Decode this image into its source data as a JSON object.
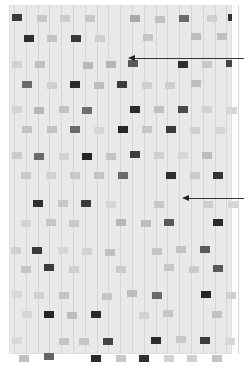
{
  "figure": {
    "kind": "sequencing gel autoradiograph",
    "gel_box": {
      "x": 9,
      "y": 5,
      "w": 223,
      "h": 349
    },
    "lane_pitch": 11.8,
    "arrows": [
      {
        "name": "upper-arrow",
        "tip_x": 128,
        "tip_y": 58,
        "tail_x": 244
      },
      {
        "name": "lower-arrow",
        "tip_x": 182,
        "tip_y": 198,
        "tail_x": 244
      }
    ],
    "bands": [
      {
        "x": 10,
        "y": 12,
        "c": "#3a3a3a"
      },
      {
        "x": 35,
        "y": 13,
        "c": "#c8c8c8"
      },
      {
        "x": 58,
        "y": 13,
        "c": "#cccccc"
      },
      {
        "x": 83,
        "y": 13,
        "c": "#c8c8c8"
      },
      {
        "x": 128,
        "y": 13,
        "c": "#a9a9a9"
      },
      {
        "x": 153,
        "y": 14,
        "c": "#c2c2c2"
      },
      {
        "x": 177,
        "y": 13,
        "c": "#6a6a6a"
      },
      {
        "x": 205,
        "y": 13,
        "c": "#d0d0d0"
      },
      {
        "x": 226,
        "y": 12,
        "c": "#333333",
        "w": 4
      },
      {
        "x": 22,
        "y": 33,
        "c": "#2e2e2e"
      },
      {
        "x": 45,
        "y": 33,
        "c": "#c4c4c4"
      },
      {
        "x": 69,
        "y": 33,
        "c": "#3a3a3a"
      },
      {
        "x": 93,
        "y": 33,
        "c": "#cfcfcf"
      },
      {
        "x": 141,
        "y": 32,
        "c": "#c6c6c6"
      },
      {
        "x": 189,
        "y": 31,
        "c": "#bdbdbd"
      },
      {
        "x": 215,
        "y": 31,
        "c": "#c0c0c0"
      },
      {
        "x": 10,
        "y": 59,
        "c": "#d2d2d2"
      },
      {
        "x": 33,
        "y": 59,
        "c": "#c0c0c0"
      },
      {
        "x": 81,
        "y": 60,
        "c": "#b8b8b8"
      },
      {
        "x": 104,
        "y": 59,
        "c": "#b5b5b5"
      },
      {
        "x": 126,
        "y": 58,
        "c": "#5a5a5a"
      },
      {
        "x": 176,
        "y": 59,
        "c": "#2f2f2f"
      },
      {
        "x": 200,
        "y": 59,
        "c": "#c8c8c8"
      },
      {
        "x": 224,
        "y": 58,
        "c": "#444444",
        "w": 6
      },
      {
        "x": 20,
        "y": 79,
        "c": "#6a6a6a"
      },
      {
        "x": 45,
        "y": 80,
        "c": "#d0d0d0"
      },
      {
        "x": 68,
        "y": 79,
        "c": "#2a2a2a"
      },
      {
        "x": 92,
        "y": 80,
        "c": "#bdbdbd"
      },
      {
        "x": 115,
        "y": 79,
        "c": "#3c3c3c"
      },
      {
        "x": 140,
        "y": 80,
        "c": "#cfcfcf"
      },
      {
        "x": 163,
        "y": 80,
        "c": "#cdcdcd"
      },
      {
        "x": 189,
        "y": 78,
        "c": "#bebebe"
      },
      {
        "x": 10,
        "y": 104,
        "c": "#d4d4d4"
      },
      {
        "x": 32,
        "y": 105,
        "c": "#b8b8b8"
      },
      {
        "x": 57,
        "y": 104,
        "c": "#c2c2c2"
      },
      {
        "x": 80,
        "y": 105,
        "c": "#6e6e6e"
      },
      {
        "x": 128,
        "y": 104,
        "c": "#2a2a2a"
      },
      {
        "x": 152,
        "y": 104,
        "c": "#c0c0c0"
      },
      {
        "x": 176,
        "y": 104,
        "c": "#4a4a4a"
      },
      {
        "x": 200,
        "y": 104,
        "c": "#d2d2d2"
      },
      {
        "x": 225,
        "y": 105,
        "c": "#d6d6d6"
      },
      {
        "x": 20,
        "y": 124,
        "c": "#c4c4c4"
      },
      {
        "x": 45,
        "y": 124,
        "c": "#c2c2c2"
      },
      {
        "x": 68,
        "y": 124,
        "c": "#6a6a6a"
      },
      {
        "x": 92,
        "y": 125,
        "c": "#d6d6d6"
      },
      {
        "x": 116,
        "y": 124,
        "c": "#262626"
      },
      {
        "x": 140,
        "y": 124,
        "c": "#c6c6c6"
      },
      {
        "x": 164,
        "y": 124,
        "c": "#3a3a3a"
      },
      {
        "x": 188,
        "y": 125,
        "c": "#d0d0d0"
      },
      {
        "x": 213,
        "y": 125,
        "c": "#d4d4d4"
      },
      {
        "x": 10,
        "y": 150,
        "c": "#cccccc"
      },
      {
        "x": 32,
        "y": 151,
        "c": "#6a6a6a"
      },
      {
        "x": 57,
        "y": 151,
        "c": "#d2d2d2"
      },
      {
        "x": 80,
        "y": 151,
        "c": "#262626"
      },
      {
        "x": 104,
        "y": 151,
        "c": "#c4c4c4"
      },
      {
        "x": 128,
        "y": 149,
        "c": "#3c3c3c"
      },
      {
        "x": 152,
        "y": 150,
        "c": "#d0d0d0"
      },
      {
        "x": 176,
        "y": 150,
        "c": "#d6d6d6"
      },
      {
        "x": 200,
        "y": 150,
        "c": "#bcbcbc"
      },
      {
        "x": 19,
        "y": 170,
        "c": "#c8c8c8"
      },
      {
        "x": 44,
        "y": 170,
        "c": "#d2d2d2"
      },
      {
        "x": 68,
        "y": 170,
        "c": "#c8c8c8"
      },
      {
        "x": 92,
        "y": 170,
        "c": "#c4c4c4"
      },
      {
        "x": 116,
        "y": 170,
        "c": "#6a6a6a"
      },
      {
        "x": 164,
        "y": 170,
        "c": "#2f2f2f"
      },
      {
        "x": 188,
        "y": 170,
        "c": "#cacaca"
      },
      {
        "x": 211,
        "y": 170,
        "c": "#333333"
      },
      {
        "x": 31,
        "y": 198,
        "c": "#2f2f2f"
      },
      {
        "x": 56,
        "y": 198,
        "c": "#c8c8c8"
      },
      {
        "x": 79,
        "y": 198,
        "c": "#3a3a3a"
      },
      {
        "x": 104,
        "y": 199,
        "c": "#d6d6d6"
      },
      {
        "x": 152,
        "y": 199,
        "c": "#c6c6c6"
      },
      {
        "x": 201,
        "y": 199,
        "c": "#cfcfcf"
      },
      {
        "x": 226,
        "y": 199,
        "c": "#d6d6d6"
      },
      {
        "x": 19,
        "y": 218,
        "c": "#d4d4d4"
      },
      {
        "x": 44,
        "y": 217,
        "c": "#c6c6c6"
      },
      {
        "x": 67,
        "y": 218,
        "c": "#cacaca"
      },
      {
        "x": 114,
        "y": 217,
        "c": "#b8b8b8"
      },
      {
        "x": 139,
        "y": 218,
        "c": "#bdbdbd"
      },
      {
        "x": 162,
        "y": 217,
        "c": "#5a5a5a"
      },
      {
        "x": 211,
        "y": 217,
        "c": "#2a2a2a"
      },
      {
        "x": 9,
        "y": 245,
        "c": "#d0d0d0"
      },
      {
        "x": 30,
        "y": 245,
        "c": "#3a3a3a"
      },
      {
        "x": 56,
        "y": 245,
        "c": "#d6d6d6"
      },
      {
        "x": 80,
        "y": 246,
        "c": "#d2d2d2"
      },
      {
        "x": 103,
        "y": 247,
        "c": "#c0c0c0"
      },
      {
        "x": 150,
        "y": 246,
        "c": "#c4c4c4"
      },
      {
        "x": 174,
        "y": 244,
        "c": "#c2c2c2"
      },
      {
        "x": 198,
        "y": 244,
        "c": "#5a5a5a"
      },
      {
        "x": 19,
        "y": 264,
        "c": "#c4c4c4"
      },
      {
        "x": 42,
        "y": 262,
        "c": "#3a3a3a"
      },
      {
        "x": 67,
        "y": 264,
        "c": "#cfcfcf"
      },
      {
        "x": 114,
        "y": 264,
        "c": "#cacaca"
      },
      {
        "x": 162,
        "y": 262,
        "c": "#c6c6c6"
      },
      {
        "x": 187,
        "y": 264,
        "c": "#cacaca"
      },
      {
        "x": 211,
        "y": 263,
        "c": "#5a5a5a"
      },
      {
        "x": 10,
        "y": 289,
        "c": "#d8d8d8"
      },
      {
        "x": 32,
        "y": 290,
        "c": "#d0d0d0"
      },
      {
        "x": 57,
        "y": 290,
        "c": "#c4c4c4"
      },
      {
        "x": 100,
        "y": 291,
        "c": "#c6c6c6"
      },
      {
        "x": 125,
        "y": 288,
        "c": "#bdbdbd"
      },
      {
        "x": 150,
        "y": 290,
        "c": "#6a6a6a"
      },
      {
        "x": 199,
        "y": 289,
        "c": "#262626"
      },
      {
        "x": 224,
        "y": 290,
        "c": "#d0d0d0"
      },
      {
        "x": 20,
        "y": 309,
        "c": "#d6d6d6"
      },
      {
        "x": 42,
        "y": 309,
        "c": "#262626"
      },
      {
        "x": 65,
        "y": 310,
        "c": "#bcbcbc"
      },
      {
        "x": 89,
        "y": 309,
        "c": "#2a2a2a"
      },
      {
        "x": 137,
        "y": 310,
        "c": "#d2d2d2"
      },
      {
        "x": 161,
        "y": 308,
        "c": "#c6c6c6"
      },
      {
        "x": 210,
        "y": 309,
        "c": "#c2c2c2"
      },
      {
        "x": 10,
        "y": 335,
        "c": "#d8d8d8"
      },
      {
        "x": 57,
        "y": 336,
        "c": "#c4c4c4"
      },
      {
        "x": 77,
        "y": 336,
        "c": "#c6c6c6"
      },
      {
        "x": 101,
        "y": 336,
        "c": "#444444"
      },
      {
        "x": 149,
        "y": 335,
        "c": "#2a2a2a"
      },
      {
        "x": 174,
        "y": 334,
        "c": "#c8c8c8"
      },
      {
        "x": 198,
        "y": 335,
        "c": "#3a3a3a"
      },
      {
        "x": 223,
        "y": 336,
        "c": "#d6d6d6"
      },
      {
        "x": 17,
        "y": 353,
        "c": "#c0c0c0"
      },
      {
        "x": 42,
        "y": 351,
        "c": "#666666"
      },
      {
        "x": 89,
        "y": 353,
        "c": "#2a2a2a"
      },
      {
        "x": 114,
        "y": 353,
        "c": "#c8c8c8"
      },
      {
        "x": 137,
        "y": 353,
        "c": "#2f2f2f"
      },
      {
        "x": 162,
        "y": 353,
        "c": "#d2d2d2"
      },
      {
        "x": 185,
        "y": 353,
        "c": "#d0d0d0"
      },
      {
        "x": 210,
        "y": 353,
        "c": "#c4c4c4"
      }
    ]
  }
}
